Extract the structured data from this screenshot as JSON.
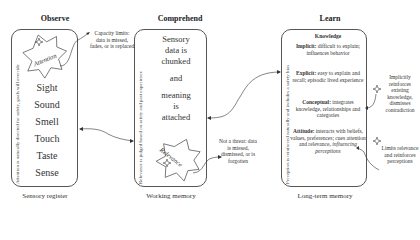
{
  "columns": [
    {
      "id": "observe",
      "heading": "Observe",
      "caption": "Sensory register",
      "side_text": "Attention is naturally directed for safety, goals will override",
      "star_label": "Attention",
      "senses": [
        "Sight",
        "Sound",
        "Smell",
        "Touch",
        "Taste",
        "Sense"
      ]
    },
    {
      "id": "comprehend",
      "heading": "Comprehend",
      "caption": "Working memory",
      "side_text": "Relevance is judged based on safety and past experience",
      "body_lines": [
        "Sensory",
        "data is",
        "chunked",
        "and",
        "meaning",
        "is",
        "attached"
      ],
      "star_label": "Relevance"
    },
    {
      "id": "learn",
      "heading": "Learn",
      "caption": "Long-term memory",
      "side_text": "Perception is reinforced naturally and includes a safety bias",
      "knowledge_title": "Knowledge",
      "knowledge_items": [
        {
          "term": "Implicit:",
          "desc": "difficult to explain; influences behavior"
        },
        {
          "term": "Explicit:",
          "desc": "easy to explain and recall; episodic lived experience"
        },
        {
          "term": "Conceptual:",
          "desc": "integrates knowledge, relationships and categories"
        },
        {
          "term": "Attitude:",
          "desc": "interacts with beliefs, values, preferences; cues attention and relevance,",
          "desc_italic": "influencing perceptions"
        }
      ]
    }
  ],
  "notes": {
    "capacity": "Capacity limits: data is missed, fades, or is replaced",
    "not_threat": "Not a threat: data is missed, dismissed, or is forgotten",
    "implicitly": "Implicitly reinforces existing knowledge, dismisses contradiction",
    "limits": "Limits relevance and reinforces perceptions"
  },
  "colors": {
    "stroke": "#555555",
    "text": "#333333",
    "background": "#ffffff"
  }
}
